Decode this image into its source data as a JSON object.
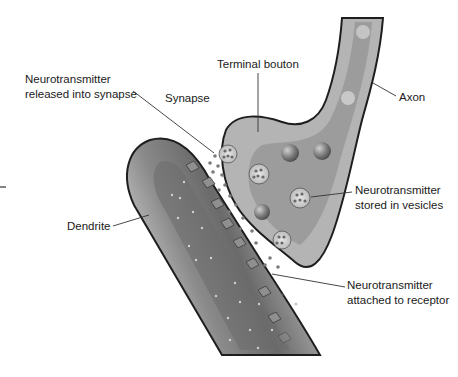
{
  "diagram": {
    "labels": {
      "released": [
        "Neurotransmitter",
        "released into synapse"
      ],
      "synapse": "Synapse",
      "terminal_bouton": "Terminal bouton",
      "axon": "Axon",
      "stored": [
        "Neurotransmitter",
        "stored in vesicles"
      ],
      "dendrite": "Dendrite",
      "attached": [
        "Neurotransmitter",
        "attached to receptor"
      ]
    },
    "colors": {
      "outline": "#1e1e1e",
      "axon_fill": "#b8b8b8",
      "axon_core": "#9a9a9a",
      "dendrite_fill": "#bdbdbd",
      "dendrite_core": "#6e6e6e",
      "text": "#1a1a1a"
    }
  }
}
